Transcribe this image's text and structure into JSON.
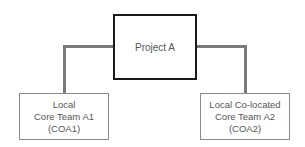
{
  "diagram": {
    "root": {
      "label": "Project A"
    },
    "children": [
      {
        "lines": [
          "Local",
          "Core Team A1",
          "(COA1)"
        ]
      },
      {
        "lines": [
          "Local Co-located",
          "Core Team A2",
          "(COA2)"
        ]
      }
    ]
  },
  "colors": {
    "root_border": "#1a1a1a",
    "connector": "#7a7a7a",
    "child_border": "#8a8a8a",
    "text": "#555555"
  }
}
